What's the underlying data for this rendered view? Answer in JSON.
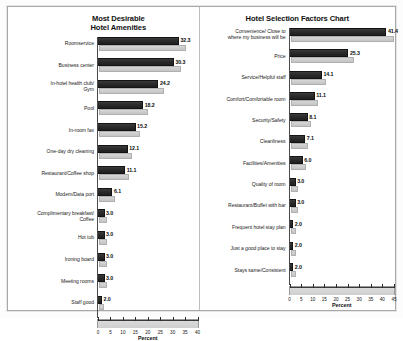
{
  "document": {
    "type": "scanned-page",
    "panels": 2
  },
  "charts": [
    {
      "title_line1": "Most Desirable",
      "title_line2": "Hotel Amenities",
      "xlabel": "Percent",
      "ticks": [
        "0",
        "5",
        "10",
        "15",
        "20",
        "25",
        "30",
        "35",
        "40"
      ],
      "rows": [
        {
          "label": "Roomservice",
          "value": "32.3"
        },
        {
          "label": "Business center",
          "value": "30.3"
        },
        {
          "label": "In-hotel health club/\nGym",
          "value": "24.2"
        },
        {
          "label": "Pool",
          "value": "18.2"
        },
        {
          "label": "In-room fax",
          "value": "15.2"
        },
        {
          "label": "One-day dry cleaning",
          "value": "12.1"
        },
        {
          "label": "Restaurant/Coffee shop",
          "value": "11.1"
        },
        {
          "label": "Modem/Data port",
          "value": "6.1"
        },
        {
          "label": "Complimentary breakfast/\nCoffee",
          "value": "3.0"
        },
        {
          "label": "Hot tub",
          "value": "3.0"
        },
        {
          "label": "Ironing board",
          "value": "3.0"
        },
        {
          "label": "Meeting rooms",
          "value": "3.0"
        },
        {
          "label": "Staff good",
          "value": "2.0"
        }
      ]
    },
    {
      "title_line1": "Hotel Selection Factors Chart",
      "title_line2": "",
      "xlabel": "Percent",
      "ticks": [
        "0",
        "5",
        "10",
        "15",
        "20",
        "25",
        "30",
        "35",
        "40",
        "45"
      ],
      "rows": [
        {
          "label": "Convenience/ Close to\nwhere my business will be",
          "value": "41.4"
        },
        {
          "label": "Price",
          "value": "25.3"
        },
        {
          "label": "Service/Helpful staff",
          "value": "14.1"
        },
        {
          "label": "Comfort/Comfortable room",
          "value": "11.1"
        },
        {
          "label": "Security/Safety",
          "value": "8.1"
        },
        {
          "label": "Cleanliness",
          "value": "7.1"
        },
        {
          "label": "Facilities/Amenities",
          "value": "6.0"
        },
        {
          "label": "Quality of room",
          "value": "3.0"
        },
        {
          "label": "Restaurant/Buffet with bar",
          "value": "3.0"
        },
        {
          "label": "Frequent hotel stay plan",
          "value": "2.0"
        },
        {
          "label": "Just a good place to stay",
          "value": "2.0"
        },
        {
          "label": "Stays same/Consistent",
          "value": "2.0"
        }
      ]
    }
  ],
  "chart_data": [
    {
      "type": "bar",
      "orientation": "horizontal",
      "title": "Most Desirable Hotel Amenities",
      "xlabel": "Percent",
      "ylabel": "",
      "xlim": [
        0,
        40
      ],
      "xticks": [
        0,
        5,
        10,
        15,
        20,
        25,
        30,
        35,
        40
      ],
      "grid": false,
      "legend": "none",
      "categories": [
        "Roomservice",
        "Business center",
        "In-hotel health club/ Gym",
        "Pool",
        "In-room fax",
        "One-day dry cleaning",
        "Restaurant/Coffee shop",
        "Modem/Data port",
        "Complimentary breakfast/ Coffee",
        "Hot tub",
        "Ironing board",
        "Meeting rooms",
        "Staff good"
      ],
      "values": [
        32.3,
        30.3,
        24.2,
        18.2,
        15.2,
        12.1,
        11.1,
        6.1,
        3.0,
        3.0,
        3.0,
        3.0,
        2.0
      ]
    },
    {
      "type": "bar",
      "orientation": "horizontal",
      "title": "Hotel Selection Factors Chart",
      "xlabel": "Percent",
      "ylabel": "",
      "xlim": [
        0,
        45
      ],
      "xticks": [
        0,
        5,
        10,
        15,
        20,
        25,
        30,
        35,
        40,
        45
      ],
      "grid": false,
      "legend": "none",
      "categories": [
        "Convenience/ Close to where my business will be",
        "Price",
        "Service/Helpful staff",
        "Comfort/Comfortable room",
        "Security/Safety",
        "Cleanliness",
        "Facilities/Amenities",
        "Quality of room",
        "Restaurant/Buffet with bar",
        "Frequent hotel stay plan",
        "Just a good place to stay",
        "Stays same/Consistent"
      ],
      "values": [
        41.4,
        25.3,
        14.1,
        11.1,
        8.1,
        7.1,
        6.0,
        3.0,
        3.0,
        2.0,
        2.0,
        2.0
      ]
    }
  ]
}
